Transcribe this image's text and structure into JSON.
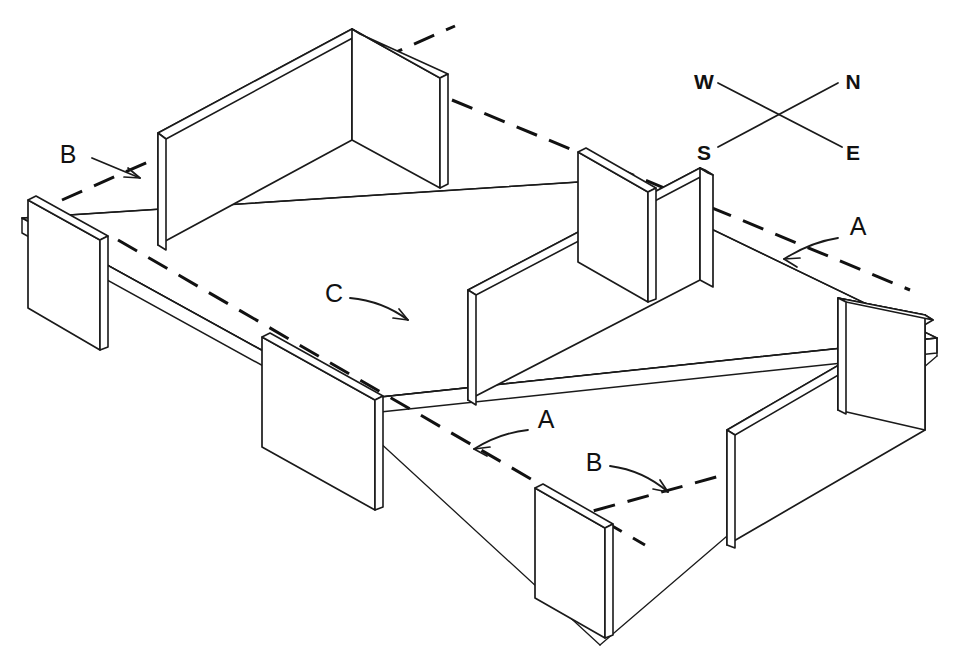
{
  "drawing": {
    "title": "Isometric wall panel layout",
    "background_color": "#ffffff",
    "line_color": "#1a1a1a",
    "projection": "isometric",
    "callouts": [
      {
        "id": "callout-b-upper-left",
        "label": "B",
        "x": 70,
        "y": 163,
        "arrow": "straight",
        "points_to": "hidden edge line, north-west slab"
      },
      {
        "id": "callout-a-right",
        "label": "A",
        "x": 855,
        "y": 233,
        "arrow": "curved",
        "points_to": "hidden edge line, north-east slab"
      },
      {
        "id": "callout-c-center",
        "label": "C",
        "x": 330,
        "y": 300,
        "arrow": "curved",
        "points_to": "hidden edge line, center of slab"
      },
      {
        "id": "callout-a-lower",
        "label": "A",
        "x": 540,
        "y": 427,
        "arrow": "curved",
        "points_to": "hidden edge line, south slab"
      },
      {
        "id": "callout-b-lower-right",
        "label": "B",
        "x": 592,
        "y": 470,
        "arrow": "curved",
        "points_to": "hidden edge line, south-east slab"
      }
    ],
    "compass": {
      "id": "compass-rose",
      "labels": {
        "west": "W",
        "north": "N",
        "south": "S",
        "east": "E"
      },
      "positions": {
        "west": {
          "x": 704,
          "y": 82
        },
        "north": {
          "x": 853,
          "y": 82
        },
        "south": {
          "x": 704,
          "y": 155
        },
        "east": {
          "x": 853,
          "y": 155
        }
      }
    },
    "elements": {
      "slab_label": "floor slab",
      "wall_panel_count": 8,
      "hidden_line_style": "dashed"
    }
  }
}
